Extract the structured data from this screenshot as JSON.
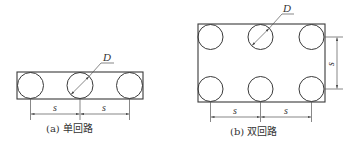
{
  "figures": [
    {
      "id": "a",
      "caption": "(a) 单回路",
      "diameter_label": "D",
      "spacing_labels": [
        "s",
        "s"
      ]
    },
    {
      "id": "b",
      "caption": "(b) 双回路",
      "diameter_label": "D",
      "spacing_labels": [
        "s",
        "s"
      ],
      "vertical_spacing_label": "s"
    }
  ],
  "colors": {
    "line": "#3a3a3a",
    "background": "#ffffff"
  }
}
